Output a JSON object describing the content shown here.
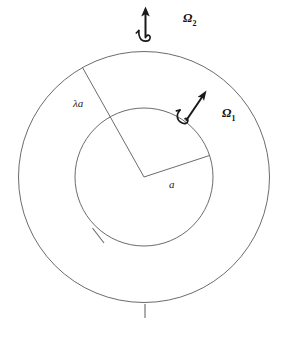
{
  "figure": {
    "background_color": "#ffffff",
    "line_color": "#5a5a5a",
    "arrow_color": "#1a1a1a",
    "geometry": {
      "center_x": 144,
      "center_y": 177,
      "outer_radius": 125,
      "inner_radius": 69
    },
    "labels": {
      "inner_radius_label": "a",
      "outer_radius_label": "λa",
      "omega_inner_symbol": "Ω",
      "omega_inner_subscript": "1",
      "omega_outer_symbol": "Ω",
      "omega_outer_subscript": "2"
    },
    "annotations": {
      "inner_tick": "inner-circle-tick-mark",
      "outer_tick": "outer-circle-tick-mark",
      "omega_inner_vector": "angular-velocity-vector-inner",
      "omega_outer_vector": "angular-velocity-vector-outer"
    }
  }
}
